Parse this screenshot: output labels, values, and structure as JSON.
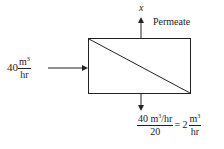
{
  "diagram": {
    "type": "membrane-separation-flow",
    "unit": {
      "shape": "rectangle-with-diagonal"
    },
    "inlet": {
      "value": "40",
      "unit_numerator": "m",
      "unit_exponent": "3",
      "unit_denominator": "hr"
    },
    "permeate": {
      "variable": "x",
      "label": "Permeate"
    },
    "retentate": {
      "numerator": "40 m",
      "numerator_exponent": "3",
      "numerator_suffix": "/hr",
      "denominator": "20",
      "equals": "= 2",
      "result_numerator": "m",
      "result_exponent": "3",
      "result_denominator": "hr"
    },
    "colors": {
      "line": "#222222",
      "background": "#ffffff"
    }
  }
}
